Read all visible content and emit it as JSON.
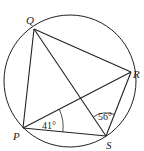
{
  "diagram": {
    "type": "cyclic-quadrilateral",
    "circle": {
      "cx": 70,
      "cy": 81,
      "r": 66
    },
    "points": {
      "P": {
        "label": "P",
        "x": 23,
        "y": 128
      },
      "Q": {
        "label": "Q",
        "x": 34,
        "y": 29
      },
      "R": {
        "label": "R",
        "x": 131,
        "y": 72
      },
      "S": {
        "label": "S",
        "x": 106,
        "y": 136
      }
    },
    "segments": [
      "PQ",
      "QR",
      "RS",
      "SP",
      "PR",
      "QS"
    ],
    "angles": [
      {
        "vertex": "P",
        "between": "RPS",
        "label": "41°"
      },
      {
        "vertex": "S",
        "between": "QSR",
        "label": "56°"
      }
    ],
    "stroke_color": "#222222"
  }
}
